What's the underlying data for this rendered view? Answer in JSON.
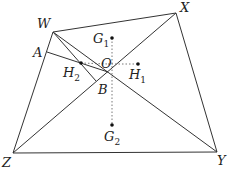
{
  "diagram": {
    "points": {
      "W": {
        "label": "W",
        "x": 53,
        "y": 32
      },
      "X": {
        "label": "X",
        "x": 176,
        "y": 13
      },
      "Y": {
        "label": "Y",
        "x": 217,
        "y": 152
      },
      "Z": {
        "label": "Z",
        "x": 13,
        "y": 153
      },
      "A": {
        "label": "A",
        "x": 47,
        "y": 52
      },
      "B": {
        "label": "B",
        "x": 100,
        "y": 79
      },
      "O": {
        "label": "O",
        "x": 108,
        "y": 72
      },
      "H1": {
        "label": "H",
        "sub": "1",
        "x": 138,
        "y": 64
      },
      "H2": {
        "label": "H",
        "sub": "2",
        "x": 81,
        "y": 63
      },
      "G1": {
        "label": "G",
        "sub": "1",
        "x": 112,
        "y": 38
      },
      "G2": {
        "label": "G",
        "sub": "2",
        "x": 112,
        "y": 125
      }
    },
    "colors": {
      "line": "#333333",
      "dotted": "#555555",
      "dot": "#111111"
    }
  }
}
